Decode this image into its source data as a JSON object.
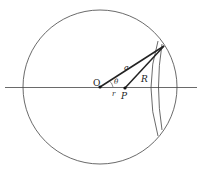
{
  "diagram": {
    "labels": {
      "origin": "O",
      "point": "P",
      "radius_a": "a",
      "distance_R": "R",
      "distance_r": "r",
      "angle": "θ"
    },
    "colors": {
      "stroke": "#333333",
      "background": "#ffffff"
    }
  }
}
